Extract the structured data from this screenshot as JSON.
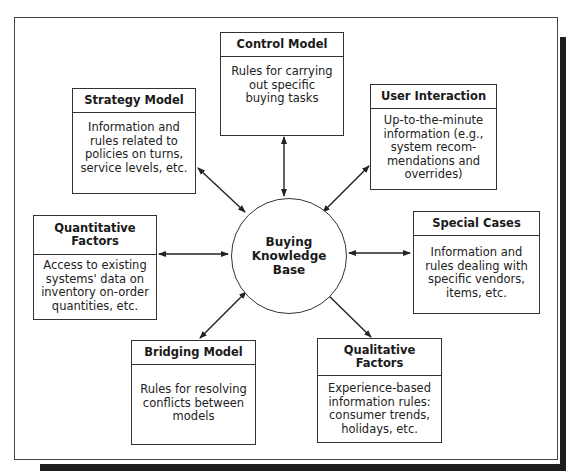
{
  "diagram": {
    "center": {
      "label": "Buying Knowledge Base"
    },
    "nodes": [
      {
        "id": "control-model",
        "title": "Control Model",
        "text": "Rules for carrying out specific buying tasks"
      },
      {
        "id": "strategy-model",
        "title": "Strategy Model",
        "text": "Information and rules related to policies on turns, service levels, etc."
      },
      {
        "id": "user-interaction",
        "title": "User Interaction",
        "text": "Up-to-the-minute information (e.g., system recom-mendations and overrides)"
      },
      {
        "id": "quantitative-factors",
        "title": "Quantitative Factors",
        "text": "Access to existing systems' data on inventory on-order quantities, etc."
      },
      {
        "id": "special-cases",
        "title": "Special Cases",
        "text": "Information and rules dealing with specific vendors, items, etc."
      },
      {
        "id": "bridging-model",
        "title": "Bridging Model",
        "text": "Rules for resolving conflicts between models"
      },
      {
        "id": "qualitative-factors",
        "title": "Qualitative Factors",
        "text": "Experience-based information rules: consumer trends, holidays, etc."
      }
    ],
    "edges": [
      {
        "from": "Control Model",
        "to": "Buying Knowledge Base",
        "type": "bidirectional"
      },
      {
        "from": "Strategy Model",
        "to": "Buying Knowledge Base",
        "type": "bidirectional"
      },
      {
        "from": "User Interaction",
        "to": "Buying Knowledge Base",
        "type": "bidirectional"
      },
      {
        "from": "Quantitative Factors",
        "to": "Buying Knowledge Base",
        "type": "bidirectional"
      },
      {
        "from": "Special Cases",
        "to": "Buying Knowledge Base",
        "type": "bidirectional"
      },
      {
        "from": "Bridging Model",
        "to": "Buying Knowledge Base",
        "type": "bidirectional"
      },
      {
        "from": "Qualitative Factors",
        "to": "Buying Knowledge Base",
        "type": "bidirectional"
      }
    ]
  },
  "colors": {
    "line": "#333333",
    "shadow": "#1e1e1e",
    "background": "#ffffff"
  }
}
